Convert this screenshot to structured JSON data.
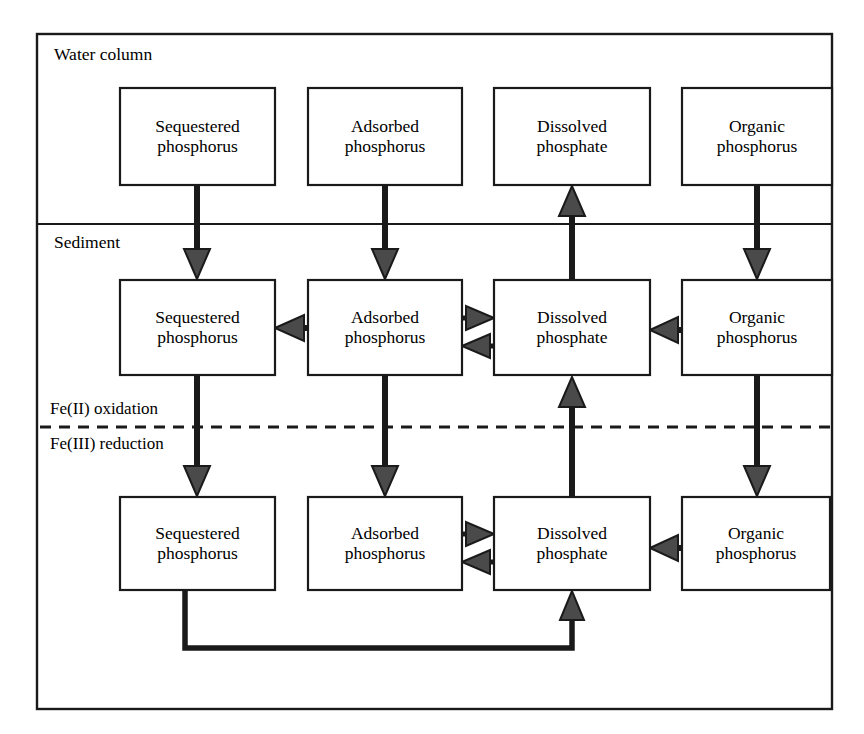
{
  "figure": {
    "type": "flow-diagram"
  },
  "zones": [
    {
      "id": "water-column",
      "label": "Water column",
      "x": 37,
      "y": 34,
      "w": 795,
      "h": 190
    },
    {
      "id": "sediment",
      "label": "Sediment",
      "x": 37,
      "y": 224,
      "w": 795,
      "h": 485
    }
  ],
  "interfaces": [
    {
      "id": "fe2-oxidation",
      "label": "Fe(II) oxidation",
      "position": "above-dashed-line"
    },
    {
      "id": "fe3-reduction",
      "label": "Fe(III) reduction",
      "position": "below-dashed-line"
    }
  ],
  "dashed_line": {
    "y": 427,
    "x1": 37,
    "x2": 832,
    "style": "dashed"
  },
  "columns": [
    {
      "id": "sequestered",
      "x": 120,
      "w": 155
    },
    {
      "id": "adsorbed",
      "x": 308,
      "w": 154
    },
    {
      "id": "dissolved",
      "x": 494,
      "w": 156
    },
    {
      "id": "organic",
      "x": 682,
      "w": 150
    }
  ],
  "rows": [
    {
      "id": "water",
      "y": 88,
      "h": 97
    },
    {
      "id": "sediment-oxic",
      "y": 280,
      "h": 95
    },
    {
      "id": "sediment-anoxic",
      "y": 497,
      "h": 93
    }
  ],
  "boxes": [
    {
      "id": "water-sequestered",
      "row": "water",
      "col": "sequestered",
      "line1": "Sequestered",
      "line2": "phosphorus",
      "x": 120,
      "y": 88,
      "w": 155,
      "h": 97
    },
    {
      "id": "water-adsorbed",
      "row": "water",
      "col": "adsorbed",
      "line1": "Adsorbed",
      "line2": "phosphorus",
      "x": 308,
      "y": 88,
      "w": 154,
      "h": 97
    },
    {
      "id": "water-dissolved",
      "row": "water",
      "col": "dissolved",
      "line1": "Dissolved",
      "line2": "phosphate",
      "x": 494,
      "y": 88,
      "w": 156,
      "h": 97
    },
    {
      "id": "water-organic",
      "row": "water",
      "col": "organic",
      "line1": "Organic",
      "line2": "phosphorus",
      "x": 682,
      "y": 88,
      "w": 150,
      "h": 97
    },
    {
      "id": "oxic-sequestered",
      "row": "sediment-oxic",
      "col": "sequestered",
      "line1": "Sequestered",
      "line2": "phosphorus",
      "x": 120,
      "y": 280,
      "w": 155,
      "h": 95
    },
    {
      "id": "oxic-adsorbed",
      "row": "sediment-oxic",
      "col": "adsorbed",
      "line1": "Adsorbed",
      "line2": "phosphorus",
      "x": 308,
      "y": 280,
      "w": 154,
      "h": 95
    },
    {
      "id": "oxic-dissolved",
      "row": "sediment-oxic",
      "col": "dissolved",
      "line1": "Dissolved",
      "line2": "phosphate",
      "x": 494,
      "y": 280,
      "w": 156,
      "h": 95
    },
    {
      "id": "oxic-organic",
      "row": "sediment-oxic",
      "col": "organic",
      "line1": "Organic",
      "line2": "phosphorus",
      "x": 682,
      "y": 280,
      "w": 150,
      "h": 95
    },
    {
      "id": "anoxic-sequestered",
      "row": "sediment-anoxic",
      "col": "sequestered",
      "line1": "Sequestered",
      "line2": "phosphorus",
      "x": 120,
      "y": 497,
      "w": 155,
      "h": 93
    },
    {
      "id": "anoxic-adsorbed",
      "row": "sediment-anoxic",
      "col": "adsorbed",
      "line1": "Adsorbed",
      "line2": "phosphorus",
      "x": 308,
      "y": 497,
      "w": 154,
      "h": 93
    },
    {
      "id": "anoxic-dissolved",
      "row": "sediment-anoxic",
      "col": "dissolved",
      "line1": "Dissolved",
      "line2": "phosphate",
      "x": 494,
      "y": 497,
      "w": 156,
      "h": 93
    },
    {
      "id": "anoxic-organic",
      "row": "sediment-anoxic",
      "col": "organic",
      "line1": "Organic",
      "line2": "phosphorus",
      "x": 682,
      "y": 497,
      "w": 148,
      "h": 93
    }
  ],
  "arrows": [
    {
      "id": "a1",
      "from": "water-sequestered",
      "to": "oxic-sequestered",
      "direction": "down"
    },
    {
      "id": "a2",
      "from": "water-adsorbed",
      "to": "oxic-adsorbed",
      "direction": "down"
    },
    {
      "id": "a3",
      "from": "oxic-dissolved",
      "to": "water-dissolved",
      "direction": "up"
    },
    {
      "id": "a4",
      "from": "water-organic",
      "to": "oxic-organic",
      "direction": "down"
    },
    {
      "id": "a5",
      "from": "oxic-adsorbed",
      "to": "oxic-sequestered",
      "direction": "left"
    },
    {
      "id": "a6",
      "from": "oxic-adsorbed",
      "to": "oxic-dissolved",
      "direction": "right"
    },
    {
      "id": "a7",
      "from": "oxic-dissolved",
      "to": "oxic-adsorbed",
      "direction": "left"
    },
    {
      "id": "a8",
      "from": "oxic-organic",
      "to": "oxic-dissolved",
      "direction": "left"
    },
    {
      "id": "a9",
      "from": "oxic-sequestered",
      "to": "anoxic-sequestered",
      "direction": "down"
    },
    {
      "id": "a10",
      "from": "oxic-adsorbed",
      "to": "anoxic-adsorbed",
      "direction": "down"
    },
    {
      "id": "a11",
      "from": "anoxic-dissolved",
      "to": "oxic-dissolved",
      "direction": "up"
    },
    {
      "id": "a12",
      "from": "oxic-organic",
      "to": "anoxic-organic",
      "direction": "down"
    },
    {
      "id": "a13",
      "from": "anoxic-adsorbed",
      "to": "anoxic-dissolved",
      "direction": "right"
    },
    {
      "id": "a14",
      "from": "anoxic-dissolved",
      "to": "anoxic-adsorbed",
      "direction": "left"
    },
    {
      "id": "a15",
      "from": "anoxic-organic",
      "to": "anoxic-dissolved",
      "direction": "left"
    },
    {
      "id": "a16",
      "from": "anoxic-sequestered",
      "to": "anoxic-dissolved",
      "direction": "feedback-loop-bottom"
    }
  ],
  "style": {
    "stroke": "#1a1a1a",
    "fill": "#ffffff",
    "frame_stroke_width": 2.2,
    "box_stroke_width": 2.0,
    "arrow_stroke_width": 5.5,
    "dash_pattern": "11,8"
  }
}
